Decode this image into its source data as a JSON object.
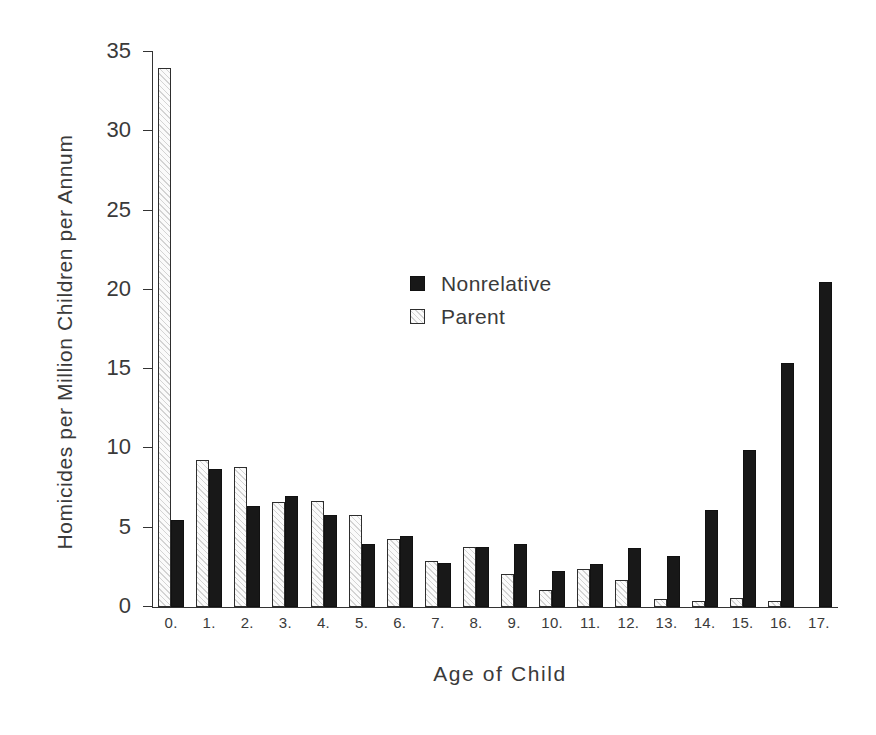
{
  "chart_data": {
    "type": "bar",
    "title": "",
    "xlabel": "Age of Child",
    "ylabel": "Homicides per Million Children per Annum",
    "categories": [
      "0.",
      "1.",
      "2.",
      "3.",
      "4.",
      "5.",
      "6.",
      "7.",
      "8.",
      "9.",
      "10.",
      "11.",
      "12.",
      "13.",
      "14.",
      "15.",
      "16.",
      "17."
    ],
    "series": [
      {
        "name": "Parent",
        "values": [
          34.0,
          9.3,
          8.8,
          6.6,
          6.7,
          5.8,
          4.3,
          2.9,
          3.8,
          2.1,
          1.1,
          2.4,
          1.7,
          0.5,
          0.4,
          0.6,
          0.4,
          0.0
        ]
      },
      {
        "name": "Nonrelative",
        "values": [
          5.5,
          8.7,
          6.4,
          7.0,
          5.8,
          4.0,
          4.5,
          2.8,
          3.8,
          4.0,
          2.3,
          2.7,
          3.7,
          3.2,
          6.1,
          9.9,
          15.4,
          20.5
        ]
      }
    ],
    "ylim": [
      0,
      35
    ],
    "yticks": [
      0,
      5,
      10,
      15,
      20,
      25,
      30,
      35
    ],
    "ytick_labels": [
      "0",
      "5",
      "10",
      "15",
      "20",
      "25",
      "30",
      "35"
    ],
    "grid": false,
    "legend_position": "inside-upper-center",
    "legend_entries": [
      {
        "label": "Nonrelative",
        "swatch": "filled-black"
      },
      {
        "label": "Parent",
        "swatch": "hatched-white"
      }
    ],
    "colors": {
      "nonrelative": "#181818",
      "parent": "#fbfbfb",
      "axis": "#333333",
      "text": "#3a3a3a",
      "background": "#ffffff"
    }
  }
}
